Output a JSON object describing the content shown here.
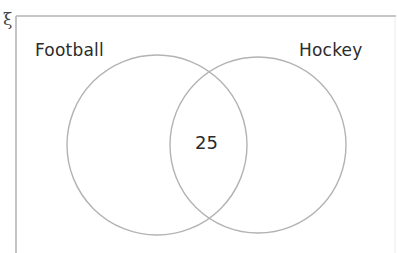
{
  "diagram": {
    "type": "venn",
    "universal_set_symbol": "ξ",
    "sets": [
      {
        "label": "Football"
      },
      {
        "label": "Hockey"
      }
    ],
    "regions": {
      "football_only": "",
      "intersection": "25",
      "hockey_only": "",
      "outside": ""
    },
    "colors": {
      "frame": "#b5b5b5",
      "circles": "#b3b3b3",
      "text": "#2b2b2b"
    }
  }
}
